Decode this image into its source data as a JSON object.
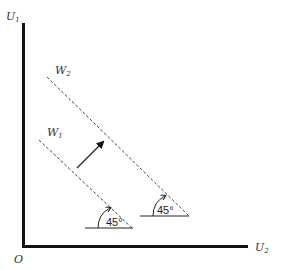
{
  "diagram": {
    "axes": {
      "y_label": "U",
      "y_label_sub": "1",
      "x_label": "U",
      "x_label_sub": "2",
      "origin_label": "O"
    },
    "lines": [
      {
        "label": "W",
        "label_sub": "2",
        "style": "dashed"
      },
      {
        "label": "W",
        "label_sub": "1",
        "style": "dashed"
      }
    ],
    "arrow": {
      "from": "W1",
      "to": "W2",
      "direction": "outward"
    },
    "angles": [
      {
        "value": "45°",
        "line": "W1"
      },
      {
        "value": "45°",
        "line": "W2"
      }
    ],
    "colors": {
      "axis": "#111111",
      "dashed_line": "#444444",
      "text": "#333333"
    }
  }
}
